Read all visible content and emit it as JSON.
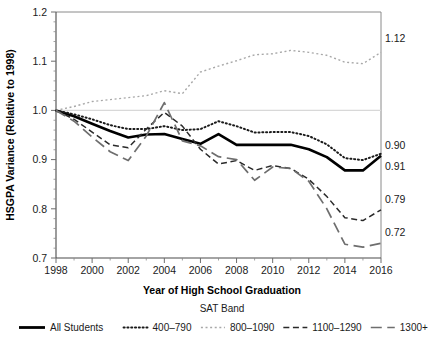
{
  "chart_data": {
    "type": "line",
    "title": "",
    "xlabel": "Year of High School Graduation",
    "ylabel": "HSGPA Variance (Relative to 1998)",
    "xlim": [
      1998,
      2016
    ],
    "ylim": [
      0.7,
      1.2
    ],
    "yticks": [
      "0.7",
      "0.8",
      "0.9",
      "1.0",
      "1.1",
      "1.2"
    ],
    "ytick_values": [
      0.7,
      0.8,
      0.9,
      1.0,
      1.1,
      1.2
    ],
    "xticks": [
      "1998",
      "2000",
      "2002",
      "2004",
      "2006",
      "2008",
      "2010",
      "2012",
      "2014",
      "2016"
    ],
    "xtick_values": [
      1998,
      2000,
      2002,
      2004,
      2006,
      2008,
      2010,
      2012,
      2014,
      2016
    ],
    "xminor_step": 1,
    "grid": "reference line at y = 1.0 only",
    "legend_title": "SAT Band",
    "legend_position": "below axis, horizontal",
    "x": [
      1998,
      1999,
      2000,
      2001,
      2002,
      2003,
      2004,
      2005,
      2006,
      2007,
      2008,
      2009,
      2010,
      2011,
      2012,
      2013,
      2014,
      2015,
      2016
    ],
    "series": [
      {
        "name": "All Students",
        "style": "solid",
        "color": "#000000",
        "width": 2.6,
        "end_label": "0.91",
        "values": [
          1.0,
          0.988,
          0.973,
          0.958,
          0.945,
          0.951,
          0.952,
          0.942,
          0.932,
          0.952,
          0.93,
          0.93,
          0.93,
          0.93,
          0.921,
          0.905,
          0.878,
          0.878,
          0.908
        ]
      },
      {
        "name": "400–790",
        "style": "dotted",
        "color": "#1a1a1a",
        "width": 2.0,
        "end_label": "0.90",
        "values": [
          1.0,
          0.992,
          0.982,
          0.97,
          0.962,
          0.962,
          0.968,
          0.96,
          0.962,
          0.978,
          0.968,
          0.955,
          0.956,
          0.956,
          0.948,
          0.931,
          0.903,
          0.899,
          0.912
        ]
      },
      {
        "name": "800–1090",
        "style": "fine-dotted",
        "color": "#a8a8a8",
        "width": 1.4,
        "end_label": "1.12",
        "values": [
          1.0,
          1.008,
          1.018,
          1.022,
          1.026,
          1.03,
          1.04,
          1.034,
          1.078,
          1.09,
          1.101,
          1.113,
          1.115,
          1.122,
          1.118,
          1.112,
          1.098,
          1.095,
          1.118
        ]
      },
      {
        "name": "1100–1290",
        "style": "dashed",
        "color": "#2a2a2a",
        "width": 1.5,
        "end_label": "0.79",
        "values": [
          1.0,
          0.982,
          0.956,
          0.93,
          0.924,
          0.962,
          0.996,
          0.968,
          0.921,
          0.891,
          0.898,
          0.878,
          0.888,
          0.882,
          0.86,
          0.825,
          0.782,
          0.776,
          0.798
        ]
      },
      {
        "name": "1300+",
        "style": "long-dash",
        "color": "#6e6e6e",
        "width": 1.7,
        "end_label": "0.72",
        "values": [
          1.0,
          0.978,
          0.946,
          0.916,
          0.898,
          0.948,
          1.016,
          0.938,
          0.928,
          0.906,
          0.9,
          0.858,
          0.885,
          0.882,
          0.856,
          0.8,
          0.728,
          0.722,
          0.73
        ]
      }
    ]
  },
  "legend": {
    "title": "SAT Band",
    "items": [
      {
        "label": "All Students",
        "style": "solid"
      },
      {
        "label": "400–790",
        "style": "dotted"
      },
      {
        "label": "800–1090",
        "style": "fine-dotted"
      },
      {
        "label": "1100–1290",
        "style": "dashed"
      },
      {
        "label": "1300+",
        "style": "long-dash"
      }
    ]
  },
  "end_labels": [
    "1.12",
    "0.90",
    "0.91",
    "0.79",
    "0.72"
  ]
}
